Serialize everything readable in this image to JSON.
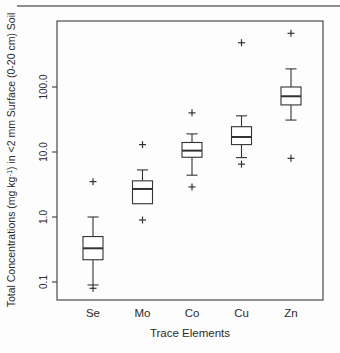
{
  "page": {
    "background": "#fdfdfd",
    "separator_color": "#8f8f8f"
  },
  "chart_data": {
    "type": "boxplot",
    "title": "",
    "xlabel": "Trace Elements",
    "ylabel": "Total Concentrations (mg kg-1) in <2 mm Surface (0-20 cm) Soil",
    "ylabel_parts": {
      "prefix": "Total Concentrations (mg kg",
      "superscript": "-1",
      "suffix": ") in <2 mm Surface (0-20 cm) Soil"
    },
    "y_scale": "log",
    "ylim": [
      0.053,
      1000
    ],
    "y_ticks": {
      "values": [
        0.1,
        1,
        10,
        100
      ],
      "labels": [
        "0.1",
        "1.0",
        "10.0",
        "100.0"
      ]
    },
    "grid": false,
    "legend": false,
    "outlier_marker": "plus",
    "line_color": "#333333",
    "frame_color": "#4a4a4a",
    "text_color": "#2b2b2b",
    "categories": [
      "Se",
      "Mo",
      "Co",
      "Cu",
      "Zn"
    ],
    "series": [
      {
        "category": "Se",
        "whisker_low": 0.09,
        "q1": 0.22,
        "median": 0.33,
        "q3": 0.5,
        "whisker_high": 1.0,
        "outliers": [
          3.5,
          0.08
        ]
      },
      {
        "category": "Mo",
        "whisker_low": 1.6,
        "q1": 1.6,
        "median": 2.7,
        "q3": 3.6,
        "whisker_high": 5.3,
        "outliers": [
          13,
          0.9
        ]
      },
      {
        "category": "Co",
        "whisker_low": 4.4,
        "q1": 8.3,
        "median": 10.5,
        "q3": 14,
        "whisker_high": 19,
        "outliers": [
          40,
          2.9
        ]
      },
      {
        "category": "Cu",
        "whisker_low": 8.2,
        "q1": 13,
        "median": 17,
        "q3": 24.5,
        "whisker_high": 36,
        "outliers": [
          480,
          6.5
        ]
      },
      {
        "category": "Zn",
        "whisker_low": 31,
        "q1": 53,
        "median": 72,
        "q3": 100,
        "whisker_high": 190,
        "outliers": [
          670,
          8
        ]
      }
    ]
  }
}
